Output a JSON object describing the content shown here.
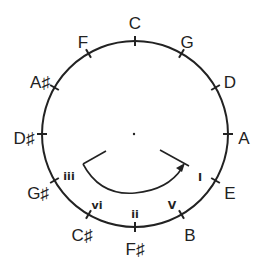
{
  "diagram": {
    "notes": [
      {
        "label": "C",
        "x": 135,
        "y": 25
      },
      {
        "label": "G",
        "x": 187,
        "y": 44
      },
      {
        "label": "D",
        "x": 230,
        "y": 84
      },
      {
        "label": "A",
        "x": 244,
        "y": 140
      },
      {
        "label": "E",
        "x": 230,
        "y": 195
      },
      {
        "label": "B",
        "x": 190,
        "y": 237
      },
      {
        "label": "F♯",
        "x": 135,
        "y": 251
      },
      {
        "label": "C♯",
        "x": 82,
        "y": 237
      },
      {
        "label": "G♯",
        "x": 38,
        "y": 195
      },
      {
        "label": "D♯",
        "x": 24,
        "y": 140
      },
      {
        "label": "A♯",
        "x": 40,
        "y": 84
      },
      {
        "label": "F",
        "x": 83,
        "y": 44
      }
    ],
    "degrees": [
      {
        "label": "I",
        "x": 200,
        "y": 178
      },
      {
        "label": "V",
        "x": 172,
        "y": 206
      },
      {
        "label": "ii",
        "x": 135,
        "y": 215
      },
      {
        "label": "vi",
        "x": 97,
        "y": 206
      },
      {
        "label": "iii",
        "x": 69,
        "y": 177
      }
    ],
    "center_dot": {
      "x": 134,
      "y": 134
    },
    "circle": {
      "cx": 135,
      "cy": 134,
      "r": 93
    },
    "color": "#222222"
  }
}
